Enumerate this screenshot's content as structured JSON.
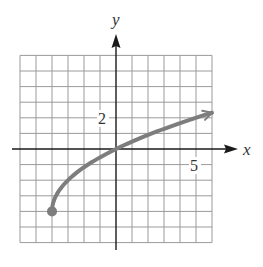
{
  "chart_data": {
    "type": "line",
    "title": "",
    "xlabel": "x",
    "ylabel": "y",
    "xlim": [
      -6,
      6
    ],
    "ylim": [
      -6,
      6
    ],
    "grid": true,
    "grid_step": 1,
    "tick_labels": [
      {
        "axis": "y",
        "value": 2,
        "label": "2"
      },
      {
        "axis": "x",
        "value": 5,
        "label": "5"
      }
    ],
    "series": [
      {
        "name": "f(x) = 2√(x+4) − 4",
        "start_point": {
          "x": -4,
          "y": -4,
          "closed_dot": true
        },
        "end_arrow": true,
        "x": [
          -4,
          -3,
          -2,
          -1,
          0,
          1,
          2,
          3,
          4,
          5,
          6
        ],
        "y": [
          -4,
          -2,
          -1.17,
          -0.47,
          0,
          0.47,
          0.9,
          1.29,
          1.66,
          2,
          2.32
        ]
      }
    ],
    "colors": {
      "curve": "#7d7d7d",
      "grid": "#9a9a9a",
      "axis": "#1a1a1a"
    }
  },
  "labels": {
    "x_axis": "x",
    "y_axis": "y",
    "y_tick": "2",
    "x_tick": "5"
  }
}
